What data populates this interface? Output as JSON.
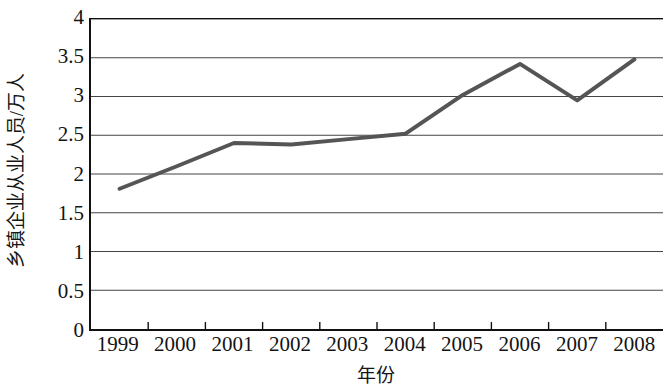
{
  "chart_data": {
    "type": "line",
    "title": "",
    "xlabel": "年份",
    "ylabel": "乡镇企业从业人员/万人",
    "categories": [
      "1999",
      "2000",
      "2001",
      "2002",
      "2003",
      "2004",
      "2005",
      "2006",
      "2007",
      "2008"
    ],
    "x": [
      1999,
      2000,
      2001,
      2002,
      2003,
      2004,
      2005,
      2006,
      2007,
      2008
    ],
    "series": [
      {
        "name": "乡镇企业从业人员",
        "values": [
          1.81,
          2.1,
          2.4,
          2.38,
          2.45,
          2.52,
          3.02,
          3.42,
          2.95,
          3.48
        ]
      }
    ],
    "values": [
      1.81,
      2.1,
      2.4,
      2.38,
      2.45,
      2.52,
      3.02,
      3.42,
      2.95,
      3.48
    ],
    "ylim": [
      0,
      4
    ],
    "ytick_labels": [
      "0",
      "0.5",
      "1",
      "1.5",
      "2",
      "2.5",
      "3",
      "3.5",
      "4"
    ],
    "ytick_values": [
      0,
      0.5,
      1,
      1.5,
      2,
      2.5,
      3,
      3.5,
      4
    ],
    "grid": "horizontal",
    "legend": "none",
    "line_color": "#555555",
    "grid_color": "#444444",
    "axis_color": "#111111"
  }
}
